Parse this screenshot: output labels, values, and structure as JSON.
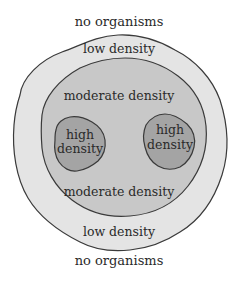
{
  "diagram": {
    "colors": {
      "background": "#ffffff",
      "low_density_fill": "#e4e4e4",
      "moderate_density_fill": "#c8c8c8",
      "high_density_fill": "#a4a4a4",
      "outline": "#3a3a3a",
      "text": "#2a2a2a"
    },
    "labels": {
      "top_outer": "no organisms",
      "top_low": "low density",
      "top_moderate": "moderate density",
      "high_left_line1": "high",
      "high_left_line2": "density",
      "high_right_line1": "high",
      "high_right_line2": "density",
      "bottom_moderate": "moderate density",
      "bottom_low": "low density",
      "bottom_outer": "no organisms"
    }
  }
}
